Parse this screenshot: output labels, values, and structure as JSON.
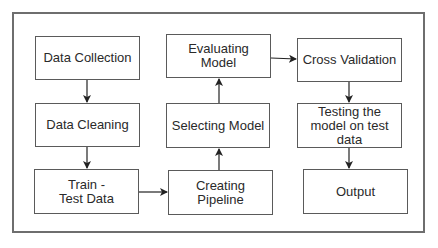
{
  "diagram": {
    "type": "flowchart",
    "title": "",
    "nodes": [
      {
        "id": "data_collection",
        "label": "Data Collection"
      },
      {
        "id": "data_cleaning",
        "label": "Data Cleaning"
      },
      {
        "id": "train_test",
        "label": "Train -Test Data"
      },
      {
        "id": "creating_pipeline",
        "label": "Creating Pipeline"
      },
      {
        "id": "selecting_model",
        "label": "Selecting Model"
      },
      {
        "id": "evaluating_model",
        "label": "Evaluating Model"
      },
      {
        "id": "cross_validation",
        "label": "Cross Validation"
      },
      {
        "id": "testing_model",
        "label": "Testing the model on test data"
      },
      {
        "id": "output",
        "label": "Output"
      }
    ],
    "edges": [
      {
        "from": "data_collection",
        "to": "data_cleaning"
      },
      {
        "from": "data_cleaning",
        "to": "train_test"
      },
      {
        "from": "train_test",
        "to": "creating_pipeline"
      },
      {
        "from": "creating_pipeline",
        "to": "selecting_model"
      },
      {
        "from": "selecting_model",
        "to": "evaluating_model"
      },
      {
        "from": "evaluating_model",
        "to": "cross_validation"
      },
      {
        "from": "cross_validation",
        "to": "testing_model"
      },
      {
        "from": "testing_model",
        "to": "output"
      }
    ]
  },
  "colors": {
    "border": "#5a5a5a",
    "frame": "#6e6e6e",
    "arrow": "#222222",
    "background": "#ffffff"
  }
}
